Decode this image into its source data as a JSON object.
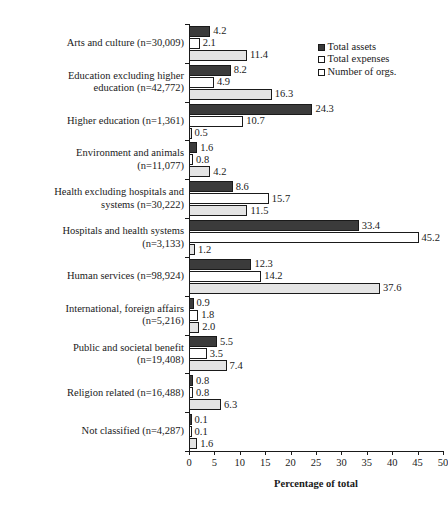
{
  "chart_data": {
    "type": "bar",
    "orientation": "horizontal",
    "title": "",
    "xlabel": "Percentage of total",
    "ylabel": "",
    "xlim": [
      0,
      50
    ],
    "xticks": [
      0,
      5,
      10,
      15,
      20,
      25,
      30,
      35,
      40,
      45,
      50
    ],
    "grid": false,
    "legend_position": "top-right",
    "categories": [
      "Arts and culture (n=30,009)",
      "Education excluding higher\neducation (n=42,772)",
      "Higher education (n=1,361)",
      "Environment and animals\n(n=11,077)",
      "Health excluding hospitals and\nsystems (n=30,222)",
      "Hospitals and health systems\n(n=3,133)",
      "Human services (n=98,924)",
      "International, foreign affairs\n(n=5,216)",
      "Public and societal benefit\n(n=19,408)",
      "Religion related (n=16,488)",
      "Not classified (n=4,287)"
    ],
    "series": [
      {
        "name": "Total assets",
        "color": "#3b3b3b",
        "values": [
          4.2,
          8.2,
          24.3,
          1.6,
          8.6,
          33.4,
          12.3,
          0.9,
          5.5,
          0.8,
          0.1
        ]
      },
      {
        "name": "Total expenses",
        "color": "#ffffff",
        "values": [
          2.1,
          4.9,
          10.7,
          0.8,
          15.7,
          45.2,
          14.2,
          1.8,
          3.5,
          0.8,
          0.1
        ]
      },
      {
        "name": "Number of orgs.",
        "color": "#e4e4e4",
        "values": [
          11.4,
          16.3,
          0.5,
          4.2,
          11.5,
          1.2,
          37.6,
          2.0,
          7.4,
          6.3,
          1.6
        ]
      }
    ]
  },
  "legend": {
    "items": [
      {
        "label": "Total assets",
        "swatch": "sw-assets"
      },
      {
        "label": "Total expenses",
        "swatch": "sw-expenses"
      },
      {
        "label": "Number of orgs.",
        "swatch": "sw-orgs"
      }
    ]
  },
  "axis": {
    "x_title": "Percentage of total",
    "tick_labels": [
      "0",
      "5",
      "10",
      "15",
      "20",
      "25",
      "30",
      "35",
      "40",
      "45",
      "50"
    ]
  }
}
